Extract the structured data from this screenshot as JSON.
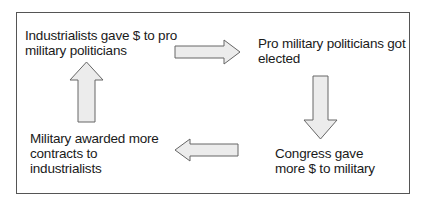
{
  "diagram": {
    "type": "cycle",
    "nodes": [
      {
        "id": "n1",
        "text": "Industrialists gave $ to pro military politicians"
      },
      {
        "id": "n2",
        "text": "Pro military politicians got elected"
      },
      {
        "id": "n3",
        "text": "Congress gave more $ to military"
      },
      {
        "id": "n4",
        "text": "Military awarded more contracts to industrialists"
      }
    ],
    "labels": {
      "n1_line1": "Industrialists gave $ to pro",
      "n1_line2": "military politicians",
      "n2_line1": "Pro military politicians got",
      "n2_line2": "elected",
      "n3_line1": "Congress gave",
      "n3_line2": "more $ to military",
      "n4_line1": "Military awarded more",
      "n4_line2": "contracts to",
      "n4_line3": "industrialists"
    },
    "edges": [
      {
        "from": "n1",
        "to": "n2",
        "direction": "right"
      },
      {
        "from": "n2",
        "to": "n3",
        "direction": "down"
      },
      {
        "from": "n3",
        "to": "n4",
        "direction": "left"
      },
      {
        "from": "n4",
        "to": "n1",
        "direction": "up"
      }
    ],
    "colors": {
      "arrow_fill": "#ececec",
      "arrow_stroke": "#666666",
      "border": "#555555",
      "text": "#1a1a1a"
    }
  }
}
